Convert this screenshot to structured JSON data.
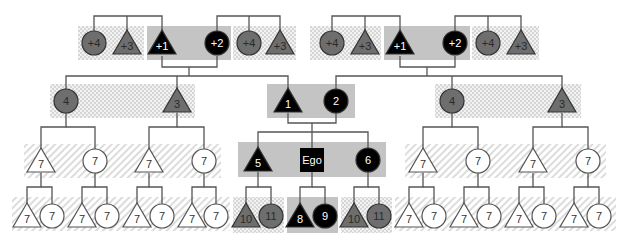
{
  "diagram": {
    "colors": {
      "background": "#ffffff",
      "line": "#555555",
      "black_fill": "#000000",
      "gray_fill": "#6e6e6e",
      "white_fill": "#ffffff",
      "solid_band": "#c4c4c4",
      "checker_band_a": "#d6d6d6",
      "checker_band_b": "#f2f2f2",
      "hatch_band": "#dcdcdc",
      "label_on_dark": "#ffffff",
      "label_on_gray": "#2a2a2a",
      "label_on_white": "#333333"
    },
    "bands": [
      {
        "id": "b1",
        "style": "checker",
        "x": 78,
        "y": 26,
        "w": 66,
        "h": 34
      },
      {
        "id": "b2",
        "style": "solid",
        "x": 147,
        "y": 26,
        "w": 84,
        "h": 34
      },
      {
        "id": "b3",
        "style": "checker",
        "x": 233,
        "y": 26,
        "w": 63,
        "h": 34
      },
      {
        "id": "b4",
        "style": "checker",
        "x": 310,
        "y": 26,
        "w": 71,
        "h": 34
      },
      {
        "id": "b5",
        "style": "solid",
        "x": 384,
        "y": 26,
        "w": 86,
        "h": 34
      },
      {
        "id": "b6",
        "style": "checker",
        "x": 472,
        "y": 26,
        "w": 67,
        "h": 34
      },
      {
        "id": "b7",
        "style": "checker",
        "x": 50,
        "y": 84,
        "w": 145,
        "h": 34
      },
      {
        "id": "b8",
        "style": "solid",
        "x": 267,
        "y": 84,
        "w": 88,
        "h": 34
      },
      {
        "id": "b9",
        "style": "checker",
        "x": 435,
        "y": 84,
        "w": 146,
        "h": 34
      },
      {
        "id": "b10",
        "style": "hatch",
        "x": 24,
        "y": 144,
        "w": 197,
        "h": 34
      },
      {
        "id": "b11",
        "style": "solid",
        "x": 238,
        "y": 142,
        "w": 148,
        "h": 35
      },
      {
        "id": "b12",
        "style": "hatch",
        "x": 405,
        "y": 144,
        "w": 201,
        "h": 34
      },
      {
        "id": "b13",
        "style": "hatch",
        "x": 12,
        "y": 197,
        "w": 218,
        "h": 34
      },
      {
        "id": "b14",
        "style": "checker",
        "x": 233,
        "y": 197,
        "w": 51,
        "h": 36
      },
      {
        "id": "b15",
        "style": "solid",
        "x": 287,
        "y": 197,
        "w": 51,
        "h": 36
      },
      {
        "id": "b16",
        "style": "checker",
        "x": 341,
        "y": 197,
        "w": 51,
        "h": 36
      },
      {
        "id": "b17",
        "style": "hatch",
        "x": 395,
        "y": 197,
        "w": 221,
        "h": 34
      }
    ],
    "nodes": [
      {
        "id": "n_p4_l1",
        "shape": "circle",
        "fill": "gray",
        "label": "+4",
        "x": 94,
        "y": 43
      },
      {
        "id": "n_p3_l1",
        "shape": "triangle",
        "fill": "gray",
        "label": "+3",
        "x": 127,
        "y": 43
      },
      {
        "id": "n_p1_l",
        "shape": "triangle",
        "fill": "black",
        "label": "+1",
        "x": 162,
        "y": 43
      },
      {
        "id": "n_p2_l",
        "shape": "circle",
        "fill": "black",
        "label": "+2",
        "x": 217,
        "y": 43
      },
      {
        "id": "n_p4_l2",
        "shape": "circle",
        "fill": "gray",
        "label": "+4",
        "x": 249,
        "y": 43
      },
      {
        "id": "n_p3_l2",
        "shape": "triangle",
        "fill": "gray",
        "label": "+3",
        "x": 280,
        "y": 43
      },
      {
        "id": "n_p4_r1",
        "shape": "circle",
        "fill": "gray",
        "label": "+4",
        "x": 332,
        "y": 43
      },
      {
        "id": "n_p3_r1",
        "shape": "triangle",
        "fill": "gray",
        "label": "+3",
        "x": 365,
        "y": 43
      },
      {
        "id": "n_p1_r",
        "shape": "triangle",
        "fill": "black",
        "label": "+1",
        "x": 400,
        "y": 43
      },
      {
        "id": "n_p2_r",
        "shape": "circle",
        "fill": "black",
        "label": "+2",
        "x": 455,
        "y": 43
      },
      {
        "id": "n_p4_r2",
        "shape": "circle",
        "fill": "gray",
        "label": "+4",
        "x": 488,
        "y": 43
      },
      {
        "id": "n_p3_r2",
        "shape": "triangle",
        "fill": "gray",
        "label": "+3",
        "x": 521,
        "y": 43
      },
      {
        "id": "n_4_l",
        "shape": "circle",
        "fill": "gray",
        "label": "4",
        "x": 66,
        "y": 101
      },
      {
        "id": "n_3_l",
        "shape": "triangle",
        "fill": "gray",
        "label": "3",
        "x": 177,
        "y": 101
      },
      {
        "id": "n_1",
        "shape": "triangle",
        "fill": "black",
        "label": "1",
        "x": 288,
        "y": 101
      },
      {
        "id": "n_2",
        "shape": "circle",
        "fill": "black",
        "label": "2",
        "x": 336,
        "y": 101
      },
      {
        "id": "n_4_r",
        "shape": "circle",
        "fill": "gray",
        "label": "4",
        "x": 452,
        "y": 101
      },
      {
        "id": "n_3_r",
        "shape": "triangle",
        "fill": "gray",
        "label": "3",
        "x": 562,
        "y": 101
      },
      {
        "id": "n_7_a",
        "shape": "triangle",
        "fill": "white",
        "label": "7",
        "x": 41,
        "y": 161
      },
      {
        "id": "n_7_b",
        "shape": "circle",
        "fill": "white",
        "label": "7",
        "x": 95,
        "y": 161
      },
      {
        "id": "n_7_c",
        "shape": "triangle",
        "fill": "white",
        "label": "7",
        "x": 149,
        "y": 161
      },
      {
        "id": "n_7_d",
        "shape": "circle",
        "fill": "white",
        "label": "7",
        "x": 204,
        "y": 161
      },
      {
        "id": "n_5",
        "shape": "triangle",
        "fill": "black",
        "label": "5",
        "x": 258,
        "y": 160
      },
      {
        "id": "n_ego",
        "shape": "square",
        "fill": "black",
        "label": "Ego",
        "x": 312,
        "y": 160
      },
      {
        "id": "n_6",
        "shape": "circle",
        "fill": "black",
        "label": "6",
        "x": 368,
        "y": 160
      },
      {
        "id": "n_7_e",
        "shape": "triangle",
        "fill": "white",
        "label": "7",
        "x": 423,
        "y": 161
      },
      {
        "id": "n_7_f",
        "shape": "circle",
        "fill": "white",
        "label": "7",
        "x": 478,
        "y": 161
      },
      {
        "id": "n_7_g",
        "shape": "triangle",
        "fill": "white",
        "label": "7",
        "x": 533,
        "y": 161
      },
      {
        "id": "n_7_h",
        "shape": "circle",
        "fill": "white",
        "label": "7",
        "x": 588,
        "y": 161
      },
      {
        "id": "n_g4_1a",
        "shape": "triangle",
        "fill": "white",
        "label": "7",
        "x": 27,
        "y": 216
      },
      {
        "id": "n_g4_1b",
        "shape": "circle",
        "fill": "white",
        "label": "7",
        "x": 52,
        "y": 216
      },
      {
        "id": "n_g4_2a",
        "shape": "triangle",
        "fill": "white",
        "label": "7",
        "x": 82,
        "y": 216
      },
      {
        "id": "n_g4_2b",
        "shape": "circle",
        "fill": "white",
        "label": "7",
        "x": 107,
        "y": 216
      },
      {
        "id": "n_g4_3a",
        "shape": "triangle",
        "fill": "white",
        "label": "7",
        "x": 137,
        "y": 216
      },
      {
        "id": "n_g4_3b",
        "shape": "circle",
        "fill": "white",
        "label": "7",
        "x": 162,
        "y": 216
      },
      {
        "id": "n_g4_4a",
        "shape": "triangle",
        "fill": "white",
        "label": "7",
        "x": 192,
        "y": 216
      },
      {
        "id": "n_g4_4b",
        "shape": "circle",
        "fill": "white",
        "label": "7",
        "x": 216,
        "y": 216
      },
      {
        "id": "n_10_l",
        "shape": "triangle",
        "fill": "gray",
        "label": "10",
        "x": 246,
        "y": 216
      },
      {
        "id": "n_11_l",
        "shape": "circle",
        "fill": "gray",
        "label": "11",
        "x": 271,
        "y": 216
      },
      {
        "id": "n_8",
        "shape": "triangle",
        "fill": "black",
        "label": "8",
        "x": 300,
        "y": 216
      },
      {
        "id": "n_9",
        "shape": "circle",
        "fill": "black",
        "label": "9",
        "x": 325,
        "y": 216
      },
      {
        "id": "n_10_r",
        "shape": "triangle",
        "fill": "gray",
        "label": "10",
        "x": 354,
        "y": 216
      },
      {
        "id": "n_11_r",
        "shape": "circle",
        "fill": "gray",
        "label": "11",
        "x": 379,
        "y": 216
      },
      {
        "id": "n_g4_5a",
        "shape": "triangle",
        "fill": "white",
        "label": "7",
        "x": 409,
        "y": 216
      },
      {
        "id": "n_g4_5b",
        "shape": "circle",
        "fill": "white",
        "label": "7",
        "x": 434,
        "y": 216
      },
      {
        "id": "n_g4_6a",
        "shape": "triangle",
        "fill": "white",
        "label": "7",
        "x": 464,
        "y": 216
      },
      {
        "id": "n_g4_6b",
        "shape": "circle",
        "fill": "white",
        "label": "7",
        "x": 489,
        "y": 216
      },
      {
        "id": "n_g4_7a",
        "shape": "triangle",
        "fill": "white",
        "label": "7",
        "x": 519,
        "y": 216
      },
      {
        "id": "n_g4_7b",
        "shape": "circle",
        "fill": "white",
        "label": "7",
        "x": 544,
        "y": 216
      },
      {
        "id": "n_g4_8a",
        "shape": "triangle",
        "fill": "white",
        "label": "7",
        "x": 574,
        "y": 216
      },
      {
        "id": "n_g4_8b",
        "shape": "circle",
        "fill": "white",
        "label": "7",
        "x": 599,
        "y": 216
      }
    ],
    "lines": [
      "M94 31 V16 H162 V31",
      "M127 31 V16",
      "M217 31 V16 H280 V31",
      "M249 31 V16",
      "M332 31 V16 H400 V31",
      "M365 31 V16",
      "M455 31 V16 H521 V31",
      "M488 31 V16",
      "M162 56 V67 H217 V56",
      "M189 67 V76",
      "M66 89 V76 H288 V89",
      "M177 89 V76",
      "M400 56 V67 H455 V56",
      "M427 67 V76",
      "M336 89 V76 H562 V89",
      "M452 89 V76",
      "M288 113 V123 H336 V113",
      "M312 123 V132",
      "M258 148 V132 H368 V148",
      "M312 132 V148",
      "M66 113 V127 H41 V149",
      "M66 127 H95 V149",
      "M177 113 V127 H149 V149",
      "M177 127 H204 V149",
      "M452 113 V127 H423 V149",
      "M452 127 H478 V149",
      "M562 113 V127 H533 V149",
      "M562 127 H588 V149",
      "M41 173 V187 H27 V204",
      "M41 187 H52 V204",
      "M95 173 V187 H82 V204",
      "M95 187 H107 V204",
      "M149 173 V187 H137 V204",
      "M149 187 H162 V204",
      "M204 173 V187 H192 V204",
      "M204 187 H216 V204",
      "M258 172 V187 H246 V204",
      "M258 187 H271 V204",
      "M312 172 V187 H300 V204",
      "M312 187 H325 V204",
      "M368 172 V187 H354 V204",
      "M368 187 H379 V204",
      "M423 173 V187 H409 V204",
      "M423 187 H434 V204",
      "M478 173 V187 H464 V204",
      "M478 187 H489 V204",
      "M533 173 V187 H519 V204",
      "M533 187 H544 V204",
      "M588 173 V187 H574 V204",
      "M588 187 H599 V204"
    ]
  }
}
